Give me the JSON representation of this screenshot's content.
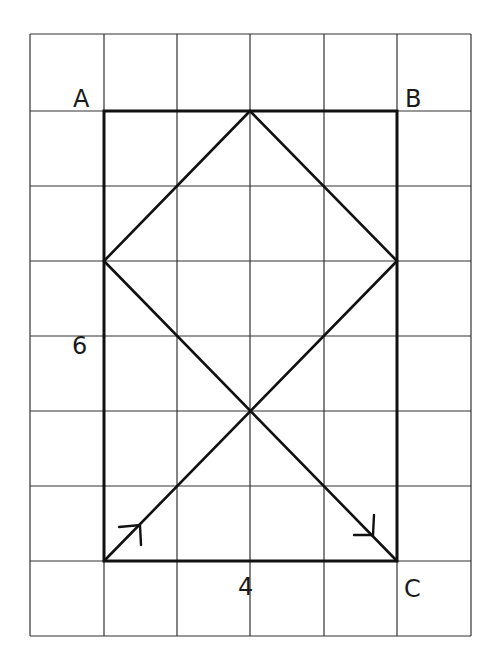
{
  "diagram": {
    "grid": {
      "x_lines": [
        30,
        104,
        177,
        250,
        324,
        397,
        471
      ],
      "y_lines": [
        34,
        111,
        186,
        261,
        336,
        411,
        486,
        561,
        636
      ],
      "color": "#333333"
    },
    "labels": {
      "A": "A",
      "B": "B",
      "C": "C",
      "width": "4",
      "height": "6"
    },
    "stroke_color": "#111111"
  }
}
